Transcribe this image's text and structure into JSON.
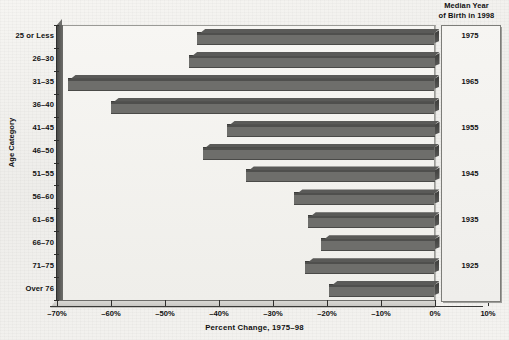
{
  "right_panel": {
    "title_line1": "Median Year",
    "title_line2": "of Birth in 1998",
    "years": [
      "1975",
      "1965",
      "1955",
      "1945",
      "1935",
      "1925"
    ]
  },
  "axes": {
    "y_title": "Age Category",
    "x_title": "Percent Change, 1975–98",
    "x_ticks": [
      "–70%",
      "–60%",
      "–50%",
      "–40%",
      "–30%",
      "–20%",
      "–10%",
      "0%",
      "10%"
    ]
  },
  "colors": {
    "bar": "#6e6e6b",
    "bar_top": "#3d3d3b",
    "wall": "#f4f3f0",
    "axis": "#2e2e2c"
  },
  "chart_data": {
    "type": "bar",
    "orientation": "horizontal",
    "title": "",
    "xlabel": "Percent Change, 1975–98",
    "ylabel": "Age Category",
    "xlim": [
      -70,
      10
    ],
    "xtick_values": [
      -70,
      -60,
      -50,
      -40,
      -30,
      -20,
      -10,
      0,
      10
    ],
    "xtick_labels": [
      "–70%",
      "–60%",
      "–50%",
      "–40%",
      "–30%",
      "–20%",
      "–10%",
      "0%",
      "10%"
    ],
    "grid": false,
    "legend": false,
    "categories": [
      "25 or Less",
      "26–30",
      "31–35",
      "36–40",
      "41–45",
      "46–50",
      "51–55",
      "56–60",
      "61–65",
      "66–70",
      "71–75",
      "Over 76"
    ],
    "values": [
      -44,
      -45.5,
      -68,
      -60,
      -38.5,
      -43,
      -35,
      -26,
      -23.5,
      -21,
      -24,
      -19.5
    ],
    "secondary_axis": {
      "label": "Median Year of Birth in 1998",
      "tick_labels": [
        "1975",
        "1965",
        "1955",
        "1945",
        "1935",
        "1925"
      ],
      "tick_categories": [
        "25 or Less",
        "31–35",
        "41–45",
        "51–55",
        "61–65",
        "71–75"
      ]
    }
  }
}
